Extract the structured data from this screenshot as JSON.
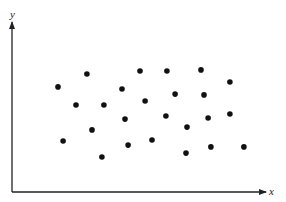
{
  "chart_data": {
    "type": "scatter",
    "title": "",
    "xlabel": "x",
    "ylabel": "y",
    "xlim": [
      0,
      100
    ],
    "ylim": [
      0,
      100
    ],
    "grid": false,
    "legend": null,
    "ticks": {
      "x": [],
      "y": []
    },
    "units_note": "No tick labels shown; coordinates normalized to axis length (0-100).",
    "series": [
      {
        "name": "points",
        "color": "#111111",
        "points": [
          {
            "x": 29.5,
            "y": 69.4
          },
          {
            "x": 50.4,
            "y": 71.2
          },
          {
            "x": 61.0,
            "y": 71.2
          },
          {
            "x": 74.4,
            "y": 71.8
          },
          {
            "x": 85.8,
            "y": 64.7
          },
          {
            "x": 18.1,
            "y": 61.8
          },
          {
            "x": 43.3,
            "y": 60.6
          },
          {
            "x": 25.2,
            "y": 51.2
          },
          {
            "x": 36.2,
            "y": 51.2
          },
          {
            "x": 52.4,
            "y": 53.5
          },
          {
            "x": 64.2,
            "y": 57.6
          },
          {
            "x": 75.6,
            "y": 57.1
          },
          {
            "x": 20.1,
            "y": 30.0
          },
          {
            "x": 31.5,
            "y": 36.5
          },
          {
            "x": 44.5,
            "y": 42.9
          },
          {
            "x": 45.7,
            "y": 27.6
          },
          {
            "x": 35.4,
            "y": 20.6
          },
          {
            "x": 55.1,
            "y": 30.6
          },
          {
            "x": 60.6,
            "y": 44.7
          },
          {
            "x": 77.2,
            "y": 43.5
          },
          {
            "x": 85.8,
            "y": 45.9
          },
          {
            "x": 68.9,
            "y": 38.2
          },
          {
            "x": 68.5,
            "y": 22.9
          },
          {
            "x": 78.3,
            "y": 26.5
          },
          {
            "x": 91.3,
            "y": 26.5
          }
        ]
      }
    ]
  },
  "layout": {
    "origin_px": [
      12,
      192
    ],
    "x_end_px": 266,
    "y_end_px": 22,
    "axis_color": "#222222",
    "dot_radius": 2.8
  }
}
